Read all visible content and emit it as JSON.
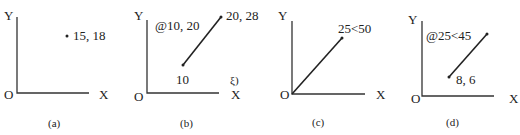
{
  "figure": {
    "panels": [
      {
        "id": "a",
        "caption": "(a)",
        "axis_labels": {
          "x": "X",
          "y": "Y",
          "origin": "O"
        },
        "annotations": [
          "15, 18"
        ],
        "description": "Single point at absolute coordinate 15,18"
      },
      {
        "id": "b",
        "caption": "(b)",
        "axis_labels": {
          "x": "X",
          "y": "Y",
          "origin": "O"
        },
        "annotations": [
          "@10, 20",
          "20, 28",
          "10",
          "3)"
        ],
        "start_label": "10",
        "end_label": "20, 28",
        "relative_label": "@10, 20",
        "partial_label": "ξ)",
        "description": "Line from start point to 20,28 using relative coordinate @10,20"
      },
      {
        "id": "c",
        "caption": "(c)",
        "axis_labels": {
          "x": "X",
          "y": "Y",
          "origin": "O"
        },
        "annotations": [
          "25<50"
        ],
        "description": "Line from origin using absolute polar coordinate 25<50"
      },
      {
        "id": "d",
        "caption": "(d)",
        "axis_labels": {
          "x": "X",
          "y": "Y",
          "origin": "O"
        },
        "annotations": [
          "@25<45",
          "8, 6"
        ],
        "description": "Line from 8,6 using relative polar coordinate @25<45"
      }
    ]
  }
}
